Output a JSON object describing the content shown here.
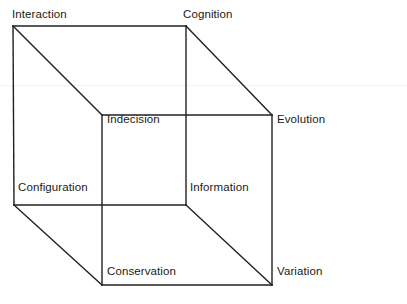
{
  "diagram": {
    "type": "cube",
    "title": "",
    "background_color": "#ffffff",
    "stroke_color": "#231f20",
    "stroke_width": 1.4,
    "text_color": "#1a1a1a",
    "canvas": {
      "width": 407,
      "height": 304
    },
    "vertices": [
      {
        "id": "interaction",
        "label": "Interaction",
        "x": 13,
        "y": 26,
        "face": "back",
        "label_x": 12,
        "label_y": 8,
        "label_anchor": "above-right"
      },
      {
        "id": "cognition",
        "label": "Cognition",
        "x": 186,
        "y": 26,
        "face": "back",
        "label_x": 183,
        "label_y": 8,
        "label_anchor": "above-right"
      },
      {
        "id": "configuration",
        "label": "Configuration",
        "x": 14,
        "y": 205,
        "face": "back",
        "label_x": 18,
        "label_y": 181,
        "label_anchor": "above-right"
      },
      {
        "id": "information",
        "label": "Information",
        "x": 186,
        "y": 205,
        "face": "back",
        "label_x": 190,
        "label_y": 181,
        "label_anchor": "right-above"
      },
      {
        "id": "indecision",
        "label": "Indecision",
        "x": 102,
        "y": 115,
        "face": "front",
        "label_x": 107,
        "label_y": 113,
        "label_anchor": "inside-right"
      },
      {
        "id": "evolution",
        "label": "Evolution",
        "x": 272,
        "y": 115,
        "face": "front",
        "label_x": 277,
        "label_y": 113,
        "label_anchor": "right"
      },
      {
        "id": "conservation",
        "label": "Conservation",
        "x": 102,
        "y": 285,
        "face": "front",
        "label_x": 107,
        "label_y": 265,
        "label_anchor": "inside-right"
      },
      {
        "id": "variation",
        "label": "Variation",
        "x": 272,
        "y": 285,
        "face": "front",
        "label_x": 277,
        "label_y": 265,
        "label_anchor": "right"
      }
    ],
    "edges": [
      {
        "id": "edge-interaction-cognition",
        "from": "interaction",
        "to": "cognition",
        "kind": "back-top"
      },
      {
        "id": "edge-cognition-information",
        "from": "cognition",
        "to": "information",
        "kind": "back-right"
      },
      {
        "id": "edge-information-configuration",
        "from": "information",
        "to": "configuration",
        "kind": "back-bottom"
      },
      {
        "id": "edge-configuration-interaction",
        "from": "configuration",
        "to": "interaction",
        "kind": "back-left"
      },
      {
        "id": "edge-indecision-evolution",
        "from": "indecision",
        "to": "evolution",
        "kind": "front-top"
      },
      {
        "id": "edge-evolution-variation",
        "from": "evolution",
        "to": "variation",
        "kind": "front-right"
      },
      {
        "id": "edge-variation-conservation",
        "from": "variation",
        "to": "conservation",
        "kind": "front-bottom"
      },
      {
        "id": "edge-conservation-indecision",
        "from": "conservation",
        "to": "indecision",
        "kind": "front-left"
      },
      {
        "id": "edge-interaction-indecision",
        "from": "interaction",
        "to": "indecision",
        "kind": "depth"
      },
      {
        "id": "edge-cognition-evolution",
        "from": "cognition",
        "to": "evolution",
        "kind": "depth"
      },
      {
        "id": "edge-configuration-conservation",
        "from": "configuration",
        "to": "conservation",
        "kind": "depth"
      },
      {
        "id": "edge-information-variation",
        "from": "information",
        "to": "variation",
        "kind": "depth"
      }
    ],
    "artifacts": [
      {
        "id": "scan-line",
        "y": 85,
        "color": "#f2f2f2"
      }
    ]
  }
}
